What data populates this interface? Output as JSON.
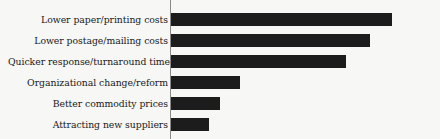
{
  "chart_data": {
    "type": "bar",
    "orientation": "horizontal",
    "title": "",
    "subtitle": "",
    "xlabel": "",
    "ylabel": "",
    "grid": false,
    "legend": null,
    "axis_line": "left-vertical",
    "xlim": [
      0,
      100
    ],
    "categories": [
      "Lower paper/printing costs",
      "Lower postage/mailing costs",
      "Quicker response/turnaround time",
      "Organizational change/reform",
      "Better commodity prices",
      "Attracting new suppliers"
    ],
    "values": [
      100,
      90,
      79,
      31,
      22,
      17
    ],
    "bar_color": "#1c1c1c",
    "background_color": "#f7f7f5",
    "axis_color": "#8a8a8a",
    "tick_labels": []
  }
}
